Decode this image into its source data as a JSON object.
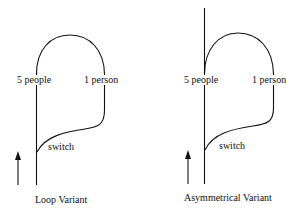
{
  "diagrams": [
    {
      "caption": "Loop Variant",
      "labels": {
        "main_track": "5 people",
        "side_track": "1 person",
        "switch": "switch"
      }
    },
    {
      "caption": "Asymmetrical Variant",
      "labels": {
        "main_track": "5 people",
        "side_track": "1 person",
        "switch": "switch"
      }
    }
  ],
  "colors": {
    "line": "#111111",
    "background": "#ffffff"
  }
}
